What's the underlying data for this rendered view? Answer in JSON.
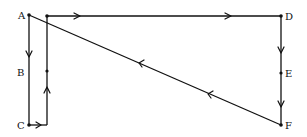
{
  "diagram": {
    "title": "",
    "points": {
      "A": {
        "label": "A",
        "x": 29,
        "y": 15
      },
      "B": {
        "label": "B",
        "x": 29,
        "y": 72
      },
      "C": {
        "label": "C",
        "x": 29,
        "y": 125
      },
      "D": {
        "label": "D",
        "x": 281,
        "y": 16
      },
      "E": {
        "label": "E",
        "x": 281,
        "y": 73
      },
      "F": {
        "label": "F",
        "x": 281,
        "y": 125
      }
    },
    "edges": [
      {
        "from": "A",
        "to": "C",
        "direction": "down",
        "arrow_at": "upper segment"
      },
      {
        "from": "C",
        "to": "corner",
        "direction": "right",
        "arrow_at": "mid"
      },
      {
        "from": "corner",
        "to": "top-left junction",
        "direction": "up",
        "arrow_at": "lower segment"
      },
      {
        "from": "top-left junction",
        "to": "D",
        "direction": "right",
        "arrow_at": "two arrows along top"
      },
      {
        "from": "D",
        "to": "F",
        "direction": "down",
        "arrow_at": "two arrows (above and below E)"
      },
      {
        "from": "F",
        "to": "A",
        "direction": "diagonal up-left",
        "arrow_at": "two arrows along diagonal"
      }
    ],
    "color": "#111111"
  }
}
